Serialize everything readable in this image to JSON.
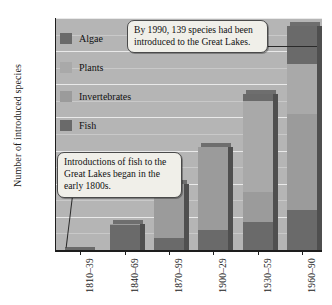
{
  "chart_data": {
    "type": "bar",
    "subtype": "stacked-bar",
    "title": "",
    "xlabel": "",
    "ylabel": "Number of introduced species",
    "ylim": [
      0,
      140
    ],
    "ytick_step": 20,
    "yminor_step": 10,
    "grid": true,
    "legend_position": "inside-top-left",
    "categories": [
      "1810–39",
      "1840–69",
      "1870–99",
      "1900–29",
      "1930–59",
      "1960–90"
    ],
    "ytick_labels": [
      "0",
      "20",
      "40",
      "60",
      "80",
      "100",
      "120",
      "140"
    ],
    "series": [
      {
        "name": "Fish",
        "values": [
          2,
          15,
          7,
          12,
          17,
          24
        ]
      },
      {
        "name": "Invertebrates",
        "values": [
          0,
          1,
          33,
          50,
          18,
          58
        ]
      },
      {
        "name": "Plants",
        "values": [
          0,
          0,
          0,
          0,
          55,
          30
        ]
      },
      {
        "name": "Algae",
        "values": [
          0,
          0,
          0,
          0,
          4,
          23
        ]
      }
    ],
    "totals": [
      2,
      16,
      40,
      62,
      94,
      135
    ],
    "annotations": [
      "By 1990, 139 species had been introduced to the Great Lakes.",
      "Introductions of fish to the Great Lakes began in the early 1800s."
    ]
  },
  "legend": {
    "items": [
      {
        "label": "Algae",
        "color": "#6a6a6a"
      },
      {
        "label": "Plants",
        "color": "#a9a9a9"
      },
      {
        "label": "Invertebrates",
        "color": "#9b9b9b"
      },
      {
        "label": "Fish",
        "color": "#6a6a6a"
      }
    ]
  },
  "callouts": {
    "species_1990": "By 1990, 139 species had been introduced to the Great Lakes.",
    "fish_1800s": "Introductions of fish to the Great Lakes began in the early 1800s."
  },
  "colors": {
    "plot_background": "#b5b5b5",
    "gridline": "#e9e9e9",
    "axis": "#1d1d1d",
    "fish": "#6a6a6a",
    "invertebrates": "#9b9b9b",
    "plants": "#a9a9a9",
    "algae": "#6a6a6a",
    "bar_side_shadow": "#4f4f4f",
    "callout_background": "#f0efe9",
    "callout_border": "#4a4a4a"
  }
}
